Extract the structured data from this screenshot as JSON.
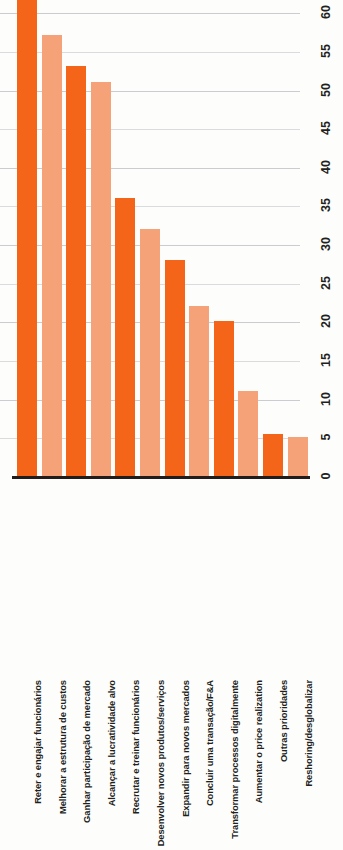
{
  "chart_data": {
    "type": "bar",
    "title": "",
    "xlabel": "",
    "ylabel": "",
    "orientation": "vertical",
    "grid": true,
    "legend": "none",
    "ylim": [
      0,
      62
    ],
    "tick_labels": [
      "0",
      "5",
      "10",
      "15",
      "20",
      "25",
      "30",
      "35",
      "40",
      "45",
      "50",
      "55",
      "60"
    ],
    "ticks": [
      0,
      5,
      10,
      15,
      20,
      25,
      30,
      35,
      40,
      45,
      50,
      55,
      60
    ],
    "categories": [
      "Reter e engajar funcionários",
      "Melhorar a estrutura de custos",
      "Ganhar participação de mercado",
      "Alcançar a lucratividade alvo",
      "Recrutar e treinar funcionários",
      "Desenvolver novos produtos/serviços",
      "Expandir para novos mercados",
      "Concluir uma transação/F&A",
      "Transformar processos digitalmente",
      "Aumentar o price realization",
      "Outras prioridades",
      "Reshoring/desglobalizar"
    ],
    "values": [
      62,
      57,
      53,
      51,
      36,
      32,
      28,
      22,
      20,
      11,
      5.5,
      5
    ],
    "colors": {
      "dark": "#f4651a",
      "light": "#f5a278",
      "axis": "#221d1a",
      "grid": "#c9ccd0",
      "background": "#fdfdfb"
    },
    "bar_color_pattern": [
      "dark",
      "light",
      "dark",
      "light",
      "dark",
      "light",
      "dark",
      "light",
      "dark",
      "light",
      "dark",
      "light"
    ]
  }
}
